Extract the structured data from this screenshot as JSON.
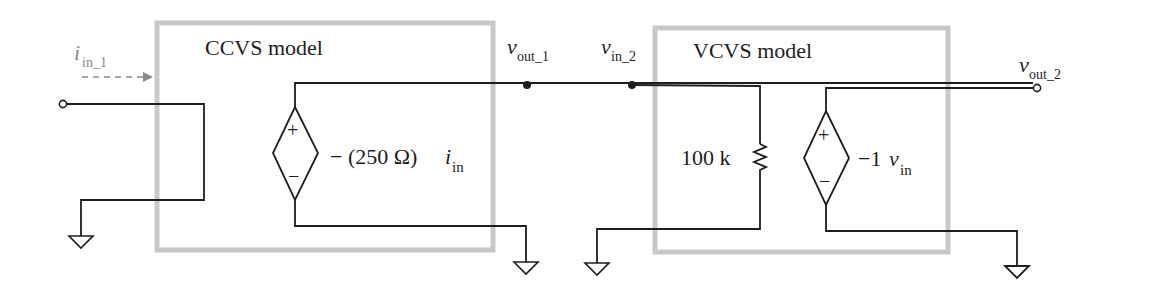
{
  "diagram": {
    "type": "circuit-schematic",
    "blocks": [
      {
        "id": "ccvs",
        "title": "CCVS model"
      },
      {
        "id": "vcvs",
        "title": "VCVS model"
      }
    ],
    "input_current": {
      "symbol": "i",
      "subscript": "in_1"
    },
    "nodes": {
      "vout1": {
        "symbol": "v",
        "subscript": "out_1"
      },
      "vin2": {
        "symbol": "v",
        "subscript": "in_2"
      },
      "vout2": {
        "symbol": "v",
        "subscript": "out_2"
      }
    },
    "ccvs_source": {
      "plus": "+",
      "minus": "−",
      "gain_prefix": "− (250 Ω)",
      "control_symbol": "i",
      "control_subscript": "in"
    },
    "resistor": {
      "label": "100 k"
    },
    "vcvs_source": {
      "plus": "+",
      "minus": "−",
      "gain_prefix": "−1",
      "control_symbol": "v",
      "control_subscript": "in"
    },
    "colors": {
      "wire": "#1e1e1e",
      "box": "#c8c8c8",
      "annotation": "#8a8a8a"
    }
  }
}
